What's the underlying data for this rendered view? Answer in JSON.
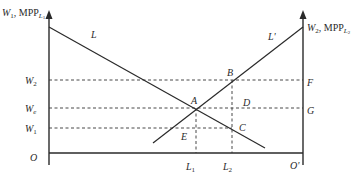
{
  "diagram": {
    "type": "two-region labor allocation (wage equalization)",
    "left_axis": {
      "label_main": "W",
      "label_sub": "1",
      "label_rest": ", MPP",
      "label_rest_sub": "L",
      "label_rest_subsub": "1"
    },
    "right_axis": {
      "label_main": "W",
      "label_sub": "2",
      "label_rest": ", MPP",
      "label_rest_sub": "L",
      "label_rest_subsub": "2"
    },
    "curves": {
      "L": "L",
      "L_prime": "L'"
    },
    "wage_levels": {
      "w2": {
        "main": "W",
        "sub": "2"
      },
      "we": {
        "main": "W",
        "sub": "e"
      },
      "w1": {
        "main": "W",
        "sub": "1"
      }
    },
    "points": {
      "A": "A",
      "B": "B",
      "C": "C",
      "D": "D",
      "E": "E",
      "F": "F",
      "G": "G"
    },
    "x_axis": {
      "origin_left": "O",
      "origin_right": "O'",
      "l1": {
        "main": "L",
        "sub": "1"
      },
      "l2": {
        "main": "L",
        "sub": "2"
      }
    },
    "colors": {
      "ink": "#2a2a2a",
      "background": "#ffffff"
    }
  }
}
